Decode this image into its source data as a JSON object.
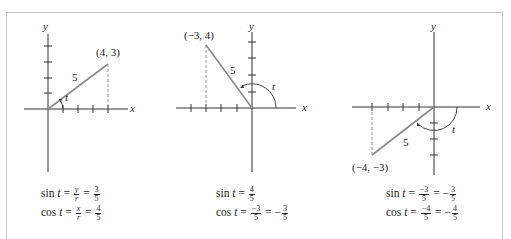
{
  "panels": [
    {
      "id": "quadrant-1",
      "axis_x_label": "x",
      "axis_y_label": "y",
      "point_label": "(4, 3)",
      "point": [
        4,
        3
      ],
      "radius_label": "5",
      "angle_label": "t",
      "sin": {
        "prefix": "sin",
        "var": "t",
        "frac1_num": "y",
        "frac1_den": "r",
        "eq": "=",
        "frac2_num": "3",
        "frac2_den": "5",
        "neg": ""
      },
      "cos": {
        "prefix": "cos",
        "var": "t",
        "frac1_num": "x",
        "frac1_den": "r",
        "eq": "=",
        "frac2_num": "4",
        "frac2_den": "5",
        "neg": ""
      }
    },
    {
      "id": "quadrant-2",
      "axis_x_label": "x",
      "axis_y_label": "y",
      "point_label": "(−3, 4)",
      "point": [
        -3,
        4
      ],
      "radius_label": "5",
      "angle_label": "t",
      "sin": {
        "prefix": "sin",
        "var": "t",
        "frac1_num": "4",
        "frac1_den": "5"
      },
      "cos": {
        "prefix": "cos",
        "var": "t",
        "frac1_num": "−3",
        "frac1_den": "5",
        "eq": "=",
        "neg": "−",
        "frac2_num": "3",
        "frac2_den": "5"
      }
    },
    {
      "id": "quadrant-3",
      "axis_x_label": "x",
      "axis_y_label": "y",
      "point_label": "(−4, −3)",
      "point": [
        -4,
        -3
      ],
      "radius_label": "5",
      "angle_label": "t",
      "sin": {
        "prefix": "sin",
        "var": "t",
        "frac1_num": "−3",
        "frac1_den": "5",
        "eq": "=",
        "neg": "−",
        "frac2_num": "3",
        "frac2_den": "5"
      },
      "cos": {
        "prefix": "cos",
        "var": "t",
        "frac1_num": "−4",
        "frac1_den": "5",
        "eq": "=",
        "neg": "−",
        "frac2_num": "4",
        "frac2_den": "5"
      }
    }
  ],
  "colors": {
    "axis": "#333333",
    "radius": "#8a8a8a",
    "dashed": "#9a9a9a",
    "frame": "#c8c8c8"
  }
}
